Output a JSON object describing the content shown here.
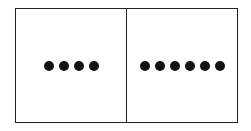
{
  "figure": {
    "type": "domino",
    "halves": [
      {
        "name": "left",
        "dot_count": 4
      },
      {
        "name": "right",
        "dot_count": 6
      }
    ],
    "colors": {
      "border": "#222222",
      "dot": "#111111",
      "background": "#ffffff"
    }
  }
}
